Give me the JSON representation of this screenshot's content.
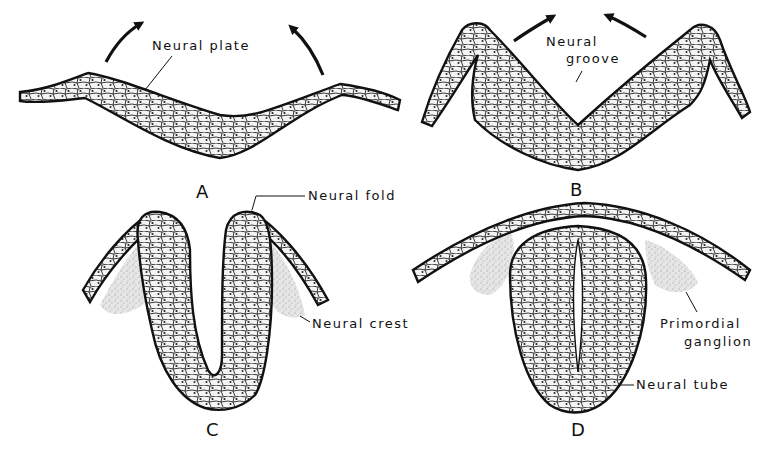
{
  "figure": {
    "panels": [
      {
        "id": "A",
        "label": "A",
        "annotations": [
          {
            "text": "Neural plate"
          }
        ]
      },
      {
        "id": "B",
        "label": "B",
        "annotations": [
          {
            "text": "Neural"
          },
          {
            "text": "groove"
          }
        ]
      },
      {
        "id": "C",
        "label": "C",
        "annotations": [
          {
            "text": "Neural fold"
          },
          {
            "text": "Neural crest"
          }
        ]
      },
      {
        "id": "D",
        "label": "D",
        "annotations": [
          {
            "text": "Primordial"
          },
          {
            "text": "ganglion"
          },
          {
            "text": "Neural tube"
          }
        ]
      }
    ]
  },
  "colors": {
    "ink": "#111111",
    "background": "#ffffff",
    "stipple": "#9a9a9a"
  }
}
